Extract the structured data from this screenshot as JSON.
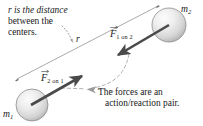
{
  "figure": {
    "background_color": "#ffffff",
    "annotations": {
      "distance_note_line1": "r is the distance",
      "distance_note_line2": "between the",
      "distance_note_line3": "centers.",
      "pair_note_line1": "The forces are an",
      "pair_note_line2": "action/reaction pair."
    },
    "labels": {
      "mass_1": "m",
      "mass_1_sub": "1",
      "mass_2": "m",
      "mass_2_sub": "2",
      "force_1on2": "F",
      "force_1on2_sub": "1 on 2",
      "force_2on1": "F",
      "force_2on1_sub": "2 on 1",
      "distance": "r"
    },
    "colors": {
      "sphere_fill_light": "#f2f2f2",
      "sphere_fill_mid": "#d8d8d8",
      "sphere_fill_dark": "#b4b4b4",
      "sphere_stroke": "#8c8c8c",
      "arrow": "#4a4a4a",
      "thin_line": "#9a9a9a",
      "dashed_line": "#a8a8a8",
      "text": "#1a1a1a"
    },
    "geometry": {
      "sphere_m1": {
        "cx": 32,
        "cy": 105,
        "r": 16
      },
      "sphere_m2": {
        "cx": 169,
        "cy": 25,
        "r": 17
      },
      "distance_line": {
        "x1": 17,
        "y1": 79,
        "x2": 158,
        "y2": 6
      },
      "force_arrow_1on2": {
        "x1": 168,
        "y1": 27,
        "x2": 116,
        "y2": 57
      },
      "force_arrow_2on1": {
        "x1": 31,
        "y1": 105,
        "x2": 83,
        "y2": 75
      }
    }
  }
}
